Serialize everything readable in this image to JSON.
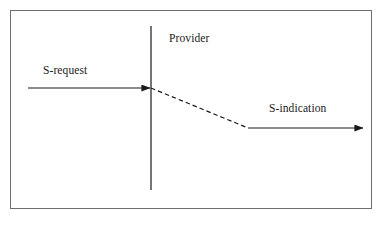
{
  "canvas": {
    "width": 384,
    "height": 226,
    "background_color": "#ffffff"
  },
  "frame": {
    "name": "outer-border",
    "x": 10,
    "y": 10,
    "width": 362,
    "height": 199,
    "stroke_color": "#6e6e6e",
    "stroke_width": 1,
    "fill": "#ffffff"
  },
  "diagram": {
    "type": "time-sequence-diagram",
    "stroke_color": "#1a1a1a",
    "labels": {
      "provider": "Provider",
      "s_request": "S-request",
      "s_indication": "S-indication"
    },
    "provider_boundary": {
      "name": "provider-vertical-line",
      "x": 151,
      "y_top": 26,
      "y_bottom": 190,
      "style": "solid",
      "stroke_width": 1.2
    },
    "arrows": [
      {
        "name": "s-request-arrow",
        "label": "S-request",
        "style": "solid",
        "from_x": 28,
        "from_y": 88,
        "to_x": 151,
        "to_y": 88,
        "arrowhead": "end",
        "stroke_width": 1.2
      },
      {
        "name": "provider-internal-delay-line",
        "label": "",
        "style": "dashed",
        "from_x": 151,
        "from_y": 88,
        "to_x": 248,
        "to_y": 128,
        "arrowhead": "none",
        "stroke_width": 1.2,
        "dash_pattern": "4.5 3"
      },
      {
        "name": "s-indication-arrow",
        "label": "S-indication",
        "style": "solid",
        "from_x": 248,
        "from_y": 128,
        "to_x": 364,
        "to_y": 128,
        "arrowhead": "end",
        "stroke_width": 1.2
      }
    ]
  }
}
